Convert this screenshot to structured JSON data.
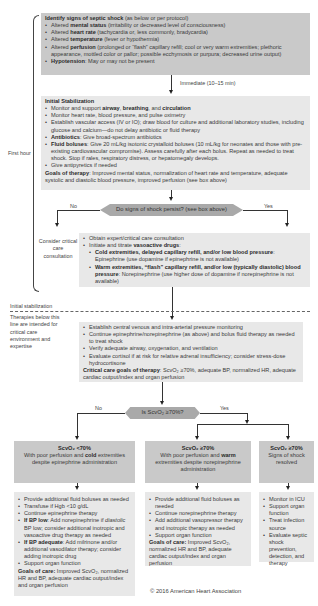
{
  "identify_box": {
    "title": "Identify signs of septic shock",
    "title_suffix": " (as below or per protocol)",
    "items": [
      {
        "pre": "Altered ",
        "bold": "mental status",
        "post": " (irritability or decreased level of consciousness)"
      },
      {
        "pre": "Altered ",
        "bold": "heart rate",
        "post": " (tachycardia or, less commonly, bradycardia)"
      },
      {
        "pre": "Altered ",
        "bold": "temperature",
        "post": " (fever or hypothermia)"
      },
      {
        "pre": "Altered ",
        "bold": "perfusion",
        "post": " (prolonged or “flash” capillary refill; cool or very warm extremities; plethoric appearance, mottled color or pallor; possible ecchymosis or purpura; decreased urine output)"
      },
      {
        "pre": "",
        "bold": "Hypotension",
        "post": ": May or may not be present"
      }
    ]
  },
  "immediate_label": "Immediate (10–15 min)",
  "stabilization_box": {
    "title": "Initial Stabilization",
    "items": [
      {
        "pre": "Monitor and support ",
        "b1": "airway",
        "m1": ", ",
        "b2": "breathing",
        "m2": ", and ",
        "b3": "circulation"
      },
      {
        "text": "Monitor heart rate, blood pressure, and pulse oximetry"
      },
      {
        "text": "Establish vascular access (IV or IO); draw blood for culture and additional laboratory studies, including glucose and calcium—do not delay antibiotic or fluid therapy"
      },
      {
        "bold": "Antibiotics",
        "post": ": Give broad-spectrum antibiotics"
      },
      {
        "bold": "Fluid boluses",
        "post": ": Give 20 mL/kg isotonic crystalloid boluses (10 mL/kg for neonates and those with pre-existing cardiovascular compromise). Assess carefully after each bolus. Repeat as needed to treat shock. Stop if rales, respiratory distress, or hepatomegaly develops."
      },
      {
        "text": "Give antipyretics if needed"
      }
    ],
    "goals_label": "Goals of therapy",
    "goals_text": ": Improved mental status, normalization of heart rate and temperature, adequate systolic and diastolic blood pressure, improved perfusion (see box above)"
  },
  "decision1": {
    "question": "Do signs of shock persist? (see box above)",
    "no_label": "No",
    "yes_label": "Yes"
  },
  "consider_consult": "Consider critical care consultation",
  "vasoactive_box": {
    "item1": "Obtain expert/critical care consultation",
    "item2_pre": "Initiate and titrate ",
    "item2_bold": "vasoactive drugs",
    "item2_post": ":",
    "sub1_bold": "Cold extremities, delayed capillary refill, and/or low blood pressure",
    "sub1_post": ": Epinephrine (use dopamine if epinephrine is not available)",
    "sub2_bold": "Warm extremities, “flash” capillary refill, and/or low (typically diastolic) blood pressure",
    "sub2_post": ": Norepinephrine (use higher dose of dopamine if norepinephrine is not available)"
  },
  "side_labels": {
    "first_hour": "First hour",
    "initial_stabilization": "Initial stabilization",
    "therapies_note": "Therapies below this line are intended for critical care environment and expertise"
  },
  "critical_box": {
    "items": [
      "Establish central venous and intra-arterial pressure monitoring",
      "Continue epinephrine/norepinephrine (as above) and bolus fluid therapy as needed to treat shock",
      "Verify adequate airway, oxygenation, and ventilation",
      "Evaluate cortisol if at risk for relative adrenal insufficiency; consider stress-dose hydrocortisone"
    ],
    "goals_label": "Critical care goals of therapy",
    "goals_text": ": ScvO₂ ≥70%, adequate BP, normalized HR, adequate cardiac output/index and organ perfusion"
  },
  "decision2": {
    "question": "Is ScvO₂ ≥70%?",
    "no_label": "No",
    "yes_label": "Yes"
  },
  "outcome_boxes": [
    {
      "title": "ScvO₂ <70%",
      "desc_pre": "With poor perfusion and ",
      "desc_bold": "cold",
      "desc_post": " extremities despite epinephrine administration"
    },
    {
      "title": "ScvO₂ ≥70%",
      "desc_pre": "With poor perfusion and ",
      "desc_bold": "warm",
      "desc_post": " extremities despite norepinephrine administration"
    },
    {
      "title": "ScvO₂ ≥70%",
      "desc_pre": "Signs of shock resolved",
      "desc_bold": "",
      "desc_post": ""
    }
  ],
  "care_boxes": {
    "left": {
      "items": [
        {
          "text": "Provide additional fluid boluses as needed"
        },
        {
          "text": "Transfuse if Hgb <10 g/dL"
        },
        {
          "text": "Continue epinephrine therapy"
        },
        {
          "bold": "If BP low",
          "post": ": Add norepinephrine if ",
          "ital": "diastolic",
          "post2": " BP low; consider additional inotropic and vasoactive drug therapy as needed"
        },
        {
          "bold": "If BP adequate",
          "post": ": Add milrinone and/or additional vasodilator therapy; consider adding inotropic drug"
        },
        {
          "text": "Support organ function"
        }
      ],
      "goals_label": "Goals of care:",
      "goals_text": " Improved ScvO₂, normalized HR and BP, adequate cardiac output/index and organ perfusion"
    },
    "middle": {
      "items": [
        "Provide additional fluid boluses as needed",
        "Continue norepinephrine therapy",
        "Add additional vasopressor therapy and inotropic therapy as needed",
        "Support organ function"
      ],
      "goals_label": "Goals of care:",
      "goals_text": " Improved ScvO₂, normalized HR and BP, adequate cardiac output/index and organ perfusion"
    },
    "right": {
      "items": [
        "Monitor in ICU",
        "Support organ function",
        "Treat infection source",
        "Evaluate septic shock prevention, detection, and therapy"
      ]
    }
  },
  "copyright": "© 2016 American Heart Association",
  "colors": {
    "dark_box": "#c9c9c9",
    "light_box": "#e8e8e8",
    "decision": "#a9a9a9",
    "text": "#3a3a3a"
  }
}
